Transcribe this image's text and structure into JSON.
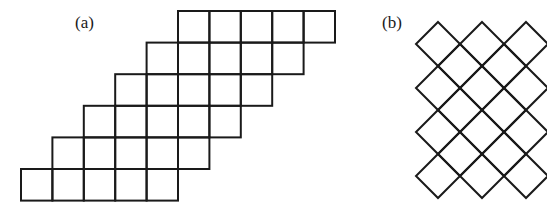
{
  "figure": {
    "panels": [
      {
        "id": "a",
        "label": "(a)",
        "description": "Staircase of square cells; 6 rows of 5 squares each, each row shifted one cell to the right going upward",
        "rows": 6,
        "cells_per_row": 5,
        "row_offsets_cells": [
          5,
          4,
          3,
          2,
          1,
          0
        ]
      },
      {
        "id": "b",
        "label": "(b)",
        "description": "Square lattice rotated 45 degrees (diamond grid), 3 diamonds wide by 4 diamonds tall",
        "columns": 3,
        "rows": 4
      }
    ],
    "colors": {
      "stroke": "#1a1a1a",
      "background": "#ffffff"
    }
  }
}
